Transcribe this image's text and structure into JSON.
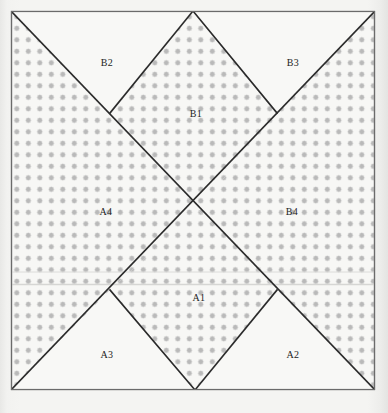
{
  "figure": {
    "canvas": {
      "width": 388,
      "height": 413
    },
    "frame": {
      "x": 11,
      "y": 11,
      "width": 364,
      "height": 379,
      "border_color": "#6b6b6b",
      "fill_color": "#f6f6f4"
    },
    "colors": {
      "line": "#2b2b2b",
      "stipple_dot": "#b9b9b9",
      "plain_fill": "#f7f7f5",
      "page_background": "#f2f2f0",
      "label_text": "#1d1d1d",
      "artifact_line": "#dcdcda"
    },
    "geometry": {
      "top_left": {
        "x": 11,
        "y": 11
      },
      "top_right": {
        "x": 375,
        "y": 11
      },
      "bottom_left": {
        "x": 11,
        "y": 390
      },
      "bottom_right": {
        "x": 375,
        "y": 390
      },
      "center": {
        "x": 198,
        "y": 210
      },
      "top_apex": {
        "x": 193,
        "y": 11
      },
      "bottom_apex": {
        "x": 195,
        "y": 390
      },
      "upper_left_vertex": {
        "x": 110,
        "y": 113
      },
      "upper_right_vertex": {
        "x": 277,
        "y": 113
      },
      "lower_left_vertex": {
        "x": 110,
        "y": 290
      },
      "lower_right_vertex": {
        "x": 277,
        "y": 290
      }
    },
    "stipple": {
      "spacing": 11.5,
      "dot_radius": 1.5,
      "glyph": "asterisk"
    },
    "artifact_lines": [
      {
        "y": 272
      },
      {
        "y": 284
      }
    ]
  },
  "labels": [
    {
      "id": "B2",
      "text": "B2",
      "x": 107,
      "y": 62,
      "region": "top-left-triangle"
    },
    {
      "id": "B3",
      "text": "B3",
      "x": 293,
      "y": 62,
      "region": "top-right-triangle"
    },
    {
      "id": "B1",
      "text": "B1",
      "x": 196,
      "y": 113,
      "region": "upper-center-diamond"
    },
    {
      "id": "A4",
      "text": "A4",
      "x": 106,
      "y": 211,
      "region": "left-triangle"
    },
    {
      "id": "B4",
      "text": "B4",
      "x": 292,
      "y": 211,
      "region": "right-triangle"
    },
    {
      "id": "A1",
      "text": "A1",
      "x": 199,
      "y": 297,
      "region": "lower-center-diamond"
    },
    {
      "id": "A3",
      "text": "A3",
      "x": 107,
      "y": 354,
      "region": "bottom-left-triangle"
    },
    {
      "id": "A2",
      "text": "A2",
      "x": 293,
      "y": 354,
      "region": "bottom-right-triangle"
    }
  ],
  "regions": [
    {
      "id": "B2",
      "shape": "triangle",
      "stippled": false,
      "points": "11,11 193,11 110,113"
    },
    {
      "id": "B3",
      "shape": "triangle",
      "stippled": false,
      "points": "193,11 375,11 277,113"
    },
    {
      "id": "A3",
      "shape": "triangle",
      "stippled": false,
      "points": "11,390 195,390 110,290"
    },
    {
      "id": "A2",
      "shape": "triangle",
      "stippled": false,
      "points": "195,390 375,390 277,290"
    },
    {
      "id": "B1",
      "shape": "quad",
      "stippled": true,
      "points": "193,11 277,113 198,210 110,113"
    },
    {
      "id": "A1",
      "shape": "quad",
      "stippled": true,
      "points": "198,210 277,290 195,390 110,290"
    },
    {
      "id": "A4",
      "shape": "quad",
      "stippled": true,
      "points": "11,11 110,113 198,210 110,290 11,390"
    },
    {
      "id": "B4",
      "shape": "quad",
      "stippled": true,
      "points": "375,11 277,113 198,210 277,290 375,390"
    }
  ]
}
